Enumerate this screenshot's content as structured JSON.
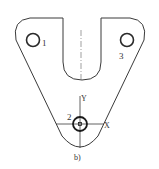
{
  "figure": {
    "caption": "b)",
    "type": "mechanical part drawing (triangular plate with U-slot and three holes)",
    "colors": {
      "line": "#3a3a3a",
      "background": "#ffffff"
    }
  },
  "holes": [
    {
      "label": "1",
      "cx": 33,
      "cy": 40
    },
    {
      "label": "2",
      "cx": 80,
      "cy": 124
    },
    {
      "label": "3",
      "cx": 129,
      "cy": 40
    }
  ],
  "axes": {
    "x_label": "X",
    "y_label": "Y"
  }
}
